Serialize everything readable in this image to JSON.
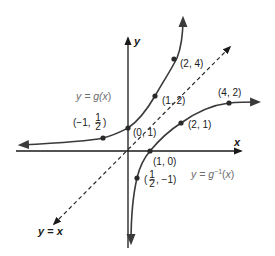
{
  "diagram": {
    "axes": {
      "x_label": "x",
      "y_label": "y"
    },
    "line_identity": {
      "label_y": "y",
      "label_eq": " = ",
      "label_x": "x",
      "style": "dashed"
    },
    "curve_g": {
      "label_prefix": "y = g(",
      "label_var": "x",
      "label_suffix": ")",
      "points": [
        {
          "label": "(−1, ½)",
          "x": -1,
          "y": 0.5
        },
        {
          "label": "(0, 1)",
          "x": 0,
          "y": 1
        },
        {
          "label": "(1, 2)",
          "x": 1,
          "y": 2
        },
        {
          "label": "(2, 4)",
          "x": 2,
          "y": 4
        }
      ]
    },
    "curve_g_inverse": {
      "label_prefix": "y = g",
      "label_sup": "−1",
      "label_open": "(",
      "label_var": "x",
      "label_suffix": ")",
      "points": [
        {
          "label": "(½, −1)",
          "x": 0.5,
          "y": -1
        },
        {
          "label": "(1, 0)",
          "x": 1,
          "y": 0
        },
        {
          "label": "(2, 1)",
          "x": 2,
          "y": 1
        },
        {
          "label": "(4, 2)",
          "x": 4,
          "y": 2
        }
      ]
    },
    "point_labels": {
      "p_neg1_half_a": "(−1, ",
      "p_neg1_half_num": "1",
      "p_neg1_half_den": "2",
      "p_neg1_half_b": ")",
      "p_0_1": "(0, 1)",
      "p_1_2": "(1, 2)",
      "p_2_4": "(2, 4)",
      "p_1_0": "(1, 0)",
      "p_2_1": "(2, 1)",
      "p_4_2": "(4, 2)",
      "p_half_neg1_a": "(",
      "p_half_neg1_num": "1",
      "p_half_neg1_den": "2",
      "p_half_neg1_b": ", −1)"
    },
    "colors": {
      "curve": "#3a3a3a",
      "axis": "#1a1a1a",
      "label_gray": "#6d6d6d"
    }
  }
}
